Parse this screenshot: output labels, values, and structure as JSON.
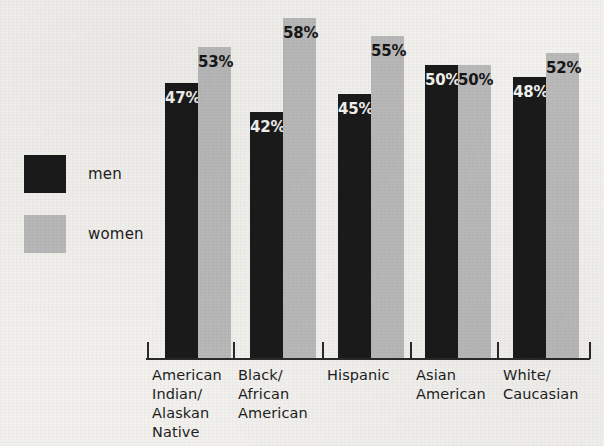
{
  "chart_data": {
    "type": "bar",
    "title": "",
    "subtitle": "",
    "xlabel": "",
    "ylabel": "",
    "ylim": [
      0,
      61
    ],
    "grid": false,
    "legend_position": "left",
    "orientation": "vertical",
    "grouping": "grouped",
    "value_suffix": "%",
    "categories": [
      "American Indian/ Alaskan Native",
      "Black/ African American",
      "Hispanic",
      "Asian American",
      "White/ Caucasian"
    ],
    "category_lines": [
      [
        "American",
        "Indian/",
        "Alaskan",
        "Native"
      ],
      [
        "Black/",
        "African",
        "American"
      ],
      [
        "Hispanic"
      ],
      [
        "Asian",
        "American"
      ],
      [
        "White/",
        "Caucasian"
      ]
    ],
    "series": [
      {
        "name": "men",
        "color": "#1a1a1a",
        "values": [
          47,
          42,
          45,
          50,
          48
        ],
        "labels": [
          "47%",
          "42%",
          "45%",
          "50%",
          "48%"
        ]
      },
      {
        "name": "women",
        "color": "#b9b9b9",
        "values": [
          53,
          58,
          55,
          50,
          52
        ],
        "labels": [
          "53%",
          "58%",
          "55%",
          "50%",
          "52%"
        ]
      }
    ]
  },
  "legend": {
    "items": [
      {
        "label": "men",
        "swatch_name": "legend-swatch-men",
        "color": "#1a1a1a"
      },
      {
        "label": "women",
        "swatch_name": "legend-swatch-women",
        "color": "#b9b9b9"
      }
    ]
  },
  "colors": {
    "background": "#f2f1ee",
    "men": "#1a1a1a",
    "women": "#b9b9b9",
    "axis": "#2a2a2a",
    "text": "#1d1d1d",
    "value_on_dark": "#f3f2ef",
    "value_on_light": "#161616"
  }
}
